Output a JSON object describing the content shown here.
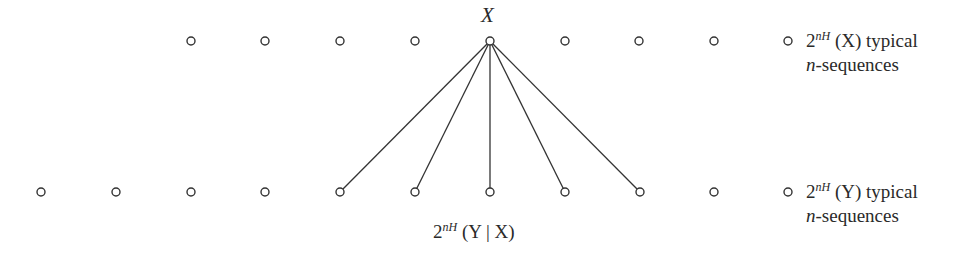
{
  "diagram": {
    "top_node_label": "X",
    "top_row": {
      "y": 41,
      "x_positions": [
        191,
        265,
        340,
        415,
        490,
        565,
        639,
        714,
        788
      ],
      "source_index": 4
    },
    "bottom_row": {
      "y": 192,
      "x_positions": [
        41,
        116,
        191,
        265,
        340,
        415,
        490,
        565,
        640,
        714,
        788
      ],
      "connected_indices": [
        4,
        5,
        6,
        7,
        8
      ]
    },
    "circle_radius": 4,
    "stroke_color": "#333333",
    "legend_top": {
      "base": "2",
      "exponent": "nH",
      "arg": "(X)",
      "suffix": "typical",
      "line2_var": "n",
      "line2_rest": "-sequences"
    },
    "legend_bottom": {
      "base": "2",
      "exponent": "nH",
      "arg": "(Y)",
      "suffix": "typical",
      "line2_var": "n",
      "line2_rest": "-sequences"
    },
    "conditional_label": {
      "base": "2",
      "exponent": "nH",
      "arg": "(Y | X)"
    }
  }
}
